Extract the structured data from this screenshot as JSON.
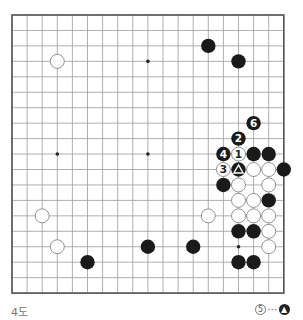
{
  "diagram": {
    "title": "4도",
    "board_size": 19,
    "origin": {
      "x": 12,
      "y": 15
    },
    "spacing": {
      "x": 15.1,
      "y": 15.45
    },
    "colors": {
      "line": "#9a9a9a",
      "border": "#555555",
      "black_stone": "#1a1a1a",
      "white_stone": "#ffffff",
      "white_stroke": "#777777"
    },
    "star_points": [
      [
        3,
        3
      ],
      [
        9,
        3
      ],
      [
        15,
        3
      ],
      [
        3,
        9
      ],
      [
        9,
        9
      ],
      [
        15,
        9
      ],
      [
        3,
        15
      ],
      [
        9,
        15
      ],
      [
        15,
        15
      ]
    ],
    "stones": [
      {
        "col": 3,
        "row": 3,
        "color": "white"
      },
      {
        "col": 13,
        "row": 2,
        "color": "black"
      },
      {
        "col": 15,
        "row": 3,
        "color": "black"
      },
      {
        "col": 16,
        "row": 7,
        "color": "black",
        "label": "6"
      },
      {
        "col": 15,
        "row": 8,
        "color": "black",
        "label": "2"
      },
      {
        "col": 14,
        "row": 9,
        "color": "black",
        "label": "4"
      },
      {
        "col": 15,
        "row": 9,
        "color": "white",
        "label": "1"
      },
      {
        "col": 16,
        "row": 9,
        "color": "black"
      },
      {
        "col": 17,
        "row": 9,
        "color": "black"
      },
      {
        "col": 14,
        "row": 10,
        "color": "white",
        "label": "3"
      },
      {
        "col": 15,
        "row": 10,
        "color": "black",
        "label": "△"
      },
      {
        "col": 16,
        "row": 10,
        "color": "white"
      },
      {
        "col": 17,
        "row": 10,
        "color": "white"
      },
      {
        "col": 18,
        "row": 10,
        "color": "black"
      },
      {
        "col": 14,
        "row": 11,
        "color": "black"
      },
      {
        "col": 15,
        "row": 11,
        "color": "white"
      },
      {
        "col": 17,
        "row": 11,
        "color": "white"
      },
      {
        "col": 15,
        "row": 12,
        "color": "white"
      },
      {
        "col": 16,
        "row": 12,
        "color": "white"
      },
      {
        "col": 17,
        "row": 12,
        "color": "black"
      },
      {
        "col": 2,
        "row": 13,
        "color": "white"
      },
      {
        "col": 13,
        "row": 13,
        "color": "white"
      },
      {
        "col": 15,
        "row": 13,
        "color": "white"
      },
      {
        "col": 16,
        "row": 13,
        "color": "white"
      },
      {
        "col": 17,
        "row": 13,
        "color": "white"
      },
      {
        "col": 15,
        "row": 14,
        "color": "black"
      },
      {
        "col": 16,
        "row": 14,
        "color": "black"
      },
      {
        "col": 17,
        "row": 14,
        "color": "white"
      },
      {
        "col": 3,
        "row": 15,
        "color": "white"
      },
      {
        "col": 9,
        "row": 15,
        "color": "black"
      },
      {
        "col": 12,
        "row": 15,
        "color": "black"
      },
      {
        "col": 17,
        "row": 15,
        "color": "white"
      },
      {
        "col": 5,
        "row": 16,
        "color": "black"
      },
      {
        "col": 15,
        "row": 16,
        "color": "black"
      },
      {
        "col": 16,
        "row": 16,
        "color": "black"
      }
    ],
    "note": {
      "move_label": "5",
      "separator": "···",
      "target_label": "▲"
    }
  }
}
